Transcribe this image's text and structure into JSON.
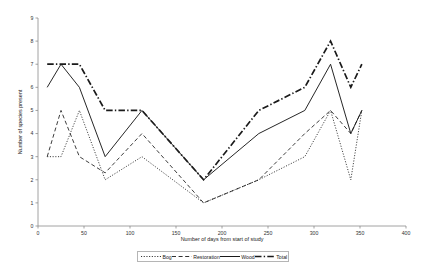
{
  "chart_data": {
    "type": "line",
    "title": "",
    "xlabel": "Number of days from start of study",
    "ylabel": "Number of species present",
    "xlim": [
      0,
      400
    ],
    "ylim": [
      0,
      9
    ],
    "xticks": [
      0,
      50,
      100,
      150,
      200,
      250,
      300,
      350,
      400
    ],
    "yticks": [
      0,
      1,
      2,
      3,
      4,
      5,
      6,
      7,
      8,
      9
    ],
    "grid": false,
    "legend_position": "bottom",
    "x": [
      10,
      25,
      45,
      73,
      113,
      180,
      240,
      290,
      318,
      340,
      352
    ],
    "series": [
      {
        "name": "Bog",
        "style": "dotted",
        "values": [
          3,
          3,
          5,
          2,
          3,
          1,
          2,
          3,
          5,
          2,
          5
        ]
      },
      {
        "name": "Restoration",
        "style": "dashed",
        "values": [
          3,
          5,
          3,
          2.3,
          4,
          1,
          2,
          4,
          5,
          4,
          5
        ]
      },
      {
        "name": "Wood",
        "style": "solid",
        "values": [
          6,
          7,
          6,
          3,
          5,
          2,
          4,
          5,
          7,
          4,
          5
        ]
      },
      {
        "name": "Total",
        "style": "dash-dot",
        "values": [
          7,
          7,
          7,
          5,
          5,
          2,
          5,
          6,
          8,
          6,
          7
        ]
      }
    ]
  },
  "axes": {
    "xlabel": "Number of days from start of study",
    "ylabel": "Number of species present",
    "xtick_labels": [
      "0",
      "50",
      "100",
      "150",
      "200",
      "250",
      "300",
      "350",
      "400"
    ],
    "ytick_labels": [
      "0",
      "1",
      "2",
      "3",
      "4",
      "5",
      "6",
      "7",
      "8",
      "9"
    ]
  },
  "legend": {
    "items": [
      {
        "label": "Bog",
        "style": "dotted"
      },
      {
        "label": "Restoration",
        "style": "dashed"
      },
      {
        "label": "Wood",
        "style": "solid"
      },
      {
        "label": "Total",
        "style": "dash-dot"
      }
    ]
  },
  "colors": {
    "line": "#1a1a1a",
    "axis": "#8c8c8c",
    "text": "#222222",
    "background": "#ffffff"
  }
}
